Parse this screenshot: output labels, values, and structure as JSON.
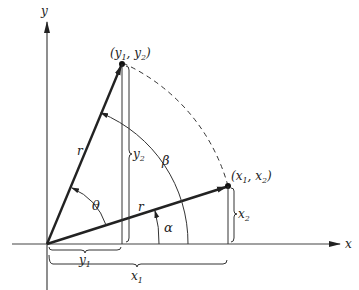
{
  "diagram": {
    "axes": {
      "x_label": "x",
      "y_label": "y"
    },
    "points": {
      "original": {
        "label_base_1": "x",
        "label_sub_1": "1",
        "label_base_2": "x",
        "label_sub_2": "2",
        "text": "(x1, x2)"
      },
      "rotated": {
        "label_base_1": "y",
        "label_sub_1": "1",
        "label_base_2": "y",
        "label_sub_2": "2",
        "text": "(y1, y2)"
      }
    },
    "labels": {
      "r_rotated": "r",
      "r_original": "r",
      "theta": "θ",
      "alpha": "α",
      "beta": "β",
      "x1": {
        "base": "x",
        "sub": "1"
      },
      "x2": {
        "base": "x",
        "sub": "2"
      },
      "y1": {
        "base": "y",
        "sub": "1"
      },
      "y2": {
        "base": "y",
        "sub": "2"
      }
    },
    "colors": {
      "stroke": "#222222",
      "axis": "#444444"
    }
  }
}
